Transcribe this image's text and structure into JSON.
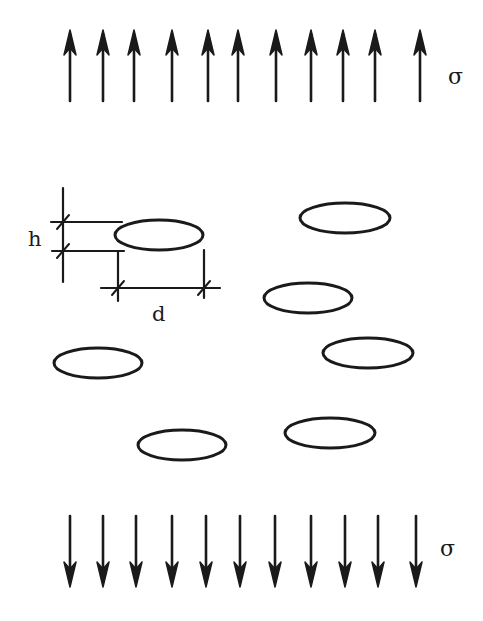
{
  "diagram": {
    "top_load": {
      "label": "σ",
      "direction": "up",
      "arrow_count": 11
    },
    "bottom_load": {
      "label": "σ",
      "direction": "down",
      "arrow_count": 11
    },
    "dimensions": {
      "height_label": "h",
      "spacing_label": "d"
    },
    "void_count": 7,
    "colors": {
      "ink": "#1a1a1a",
      "background": "#ffffff"
    }
  }
}
